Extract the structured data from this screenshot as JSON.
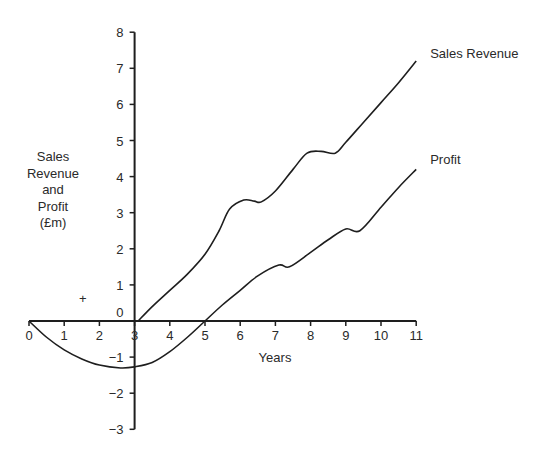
{
  "chart_data": {
    "type": "line",
    "title": "",
    "xlabel": "Years",
    "ylabel": "Sales Revenue and Profit (£m)",
    "ylabel_lines": [
      "Sales",
      "Revenue",
      "and",
      "Profit",
      "(£m)"
    ],
    "xlim": [
      0,
      11
    ],
    "ylim": [
      -3,
      8
    ],
    "x_ticks": [
      0,
      1,
      2,
      3,
      4,
      5,
      6,
      7,
      8,
      9,
      10,
      11
    ],
    "y_ticks": [
      -3,
      -2,
      -1,
      0,
      1,
      2,
      3,
      4,
      5,
      6,
      7,
      8
    ],
    "x_tick_labels": [
      "0",
      "1",
      "2",
      "3",
      "4",
      "5",
      "6",
      "7",
      "8",
      "9",
      "10",
      "11"
    ],
    "y_tick_labels": [
      "−3",
      "−2",
      "−1",
      "0",
      "1",
      "2",
      "3",
      "4",
      "5",
      "6",
      "7",
      "8"
    ],
    "grid": false,
    "legend": "inline labels at line ends",
    "series": [
      {
        "name": "Sales Revenue",
        "x": [
          3.1,
          3.5,
          4.0,
          4.5,
          5.0,
          5.4,
          5.7,
          6.1,
          6.4,
          6.6,
          7.0,
          7.5,
          7.9,
          8.3,
          8.7,
          9.0,
          9.5,
          10.0,
          10.5,
          11.0
        ],
        "values": [
          0.0,
          0.4,
          0.85,
          1.3,
          1.85,
          2.5,
          3.1,
          3.35,
          3.32,
          3.3,
          3.6,
          4.2,
          4.65,
          4.7,
          4.65,
          4.95,
          5.5,
          6.05,
          6.6,
          7.2
        ]
      },
      {
        "name": "Profit",
        "x": [
          0.0,
          0.5,
          1.0,
          1.5,
          2.0,
          2.6,
          3.0,
          3.5,
          4.0,
          4.5,
          5.0,
          5.5,
          6.0,
          6.5,
          7.1,
          7.4,
          8.0,
          8.5,
          9.0,
          9.4,
          10.0,
          10.5,
          11.0
        ],
        "values": [
          0.0,
          -0.45,
          -0.8,
          -1.05,
          -1.22,
          -1.3,
          -1.27,
          -1.15,
          -0.85,
          -0.45,
          0.0,
          0.45,
          0.85,
          1.25,
          1.55,
          1.5,
          1.9,
          2.25,
          2.55,
          2.5,
          3.15,
          3.7,
          4.2
        ]
      }
    ],
    "annotations": [
      {
        "text": "+",
        "x": 1.5,
        "y": 0.6
      }
    ]
  },
  "colors": {
    "line": "#1e1e1e",
    "axis": "#1e1e1e",
    "background": "#ffffff"
  }
}
